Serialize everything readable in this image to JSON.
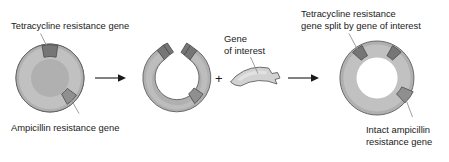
{
  "figure": {
    "background_color": "#ffffff"
  },
  "colors": {
    "ring_fill": "#b0b0b0",
    "ring_highlight": "#c9c9c9",
    "ring_stroke": "#5e5e5e",
    "gene_dark": "#767676",
    "gene_amp": "#8f8f8f",
    "insert_fill": "#d2d2d2",
    "text": "#1a1a1a",
    "leader_line": "#8d8d8d",
    "arrow": "#1a1a1a"
  },
  "labels": {
    "tetracycline": "Tetracycline resistance gene",
    "ampicillin": "Ampicillin resistance gene",
    "gene_of_interest_line1": "Gene",
    "gene_of_interest_line2": "of interest",
    "split_tet_line1": "Tetracycline resistance",
    "split_tet_line2": "gene split by gene of interest",
    "intact_amp_line1": "Intact ampicillin",
    "intact_amp_line2": "resistance gene",
    "plus": "+"
  },
  "stages": [
    {
      "id": "intact-plasmid",
      "name": "Intact plasmid",
      "genes": [
        "tetracycline resistance gene",
        "ampicillin resistance gene"
      ],
      "state": "circular closed"
    },
    {
      "id": "cut-plasmid",
      "name": "Plasmid cut open within tetracycline resistance gene",
      "genes": [
        "tetracycline resistance gene (cut)",
        "ampicillin resistance gene"
      ],
      "state": "linearized open ring with sticky ends"
    },
    {
      "id": "gene-of-interest",
      "name": "Gene of interest fragment",
      "genes": [
        "gene of interest"
      ],
      "state": "arc fragment with sticky ends"
    },
    {
      "id": "recombinant-plasmid",
      "name": "Recombinant plasmid",
      "genes": [
        "tetracycline resistance gene split by gene of interest",
        "intact ampicillin resistance gene"
      ],
      "state": "circular closed with insert"
    }
  ],
  "arrows": [
    {
      "id": "arrow-1",
      "from": "intact-plasmid",
      "to": "cut-plasmid"
    },
    {
      "id": "arrow-2",
      "from": "gene-of-interest",
      "to": "recombinant-plasmid"
    }
  ]
}
